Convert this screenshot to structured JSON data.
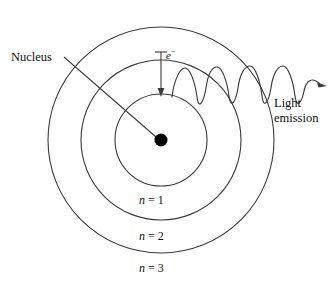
{
  "figure": {
    "type": "bohr-atomic-model-diagram",
    "background_color": "#ffffff",
    "stroke_color": "#3a3a3a",
    "nucleus_fill": "#000000"
  },
  "labels": {
    "nucleus": "Nucleus",
    "electron_symbol": "e",
    "electron_charge": "−",
    "light_emission_line1": "Light",
    "light_emission_line2": "emission",
    "shell_1_n": "n",
    "shell_1_value": "= 1",
    "shell_2_n": "n",
    "shell_2_value": "= 2",
    "shell_3_n": "n",
    "shell_3_value": "= 3"
  },
  "geometry": {
    "center_x": 161,
    "center_y": 140,
    "nucleus_radius": 6,
    "shells": [
      {
        "name": "n = 1",
        "radius": 46
      },
      {
        "name": "n = 2",
        "radius": 80
      },
      {
        "name": "n = 3",
        "radius": 113
      }
    ],
    "electron_transition_arrow": {
      "from_x": 161,
      "from_y": 52,
      "to_x": 161,
      "to_y": 96,
      "cap_x1": 155,
      "cap_x2": 167,
      "cap_y": 52
    },
    "nucleus_leader_line": {
      "from_x": 64,
      "from_y": 57,
      "to_x": 156,
      "to_y": 137
    },
    "light_wave": {
      "start_x": 172,
      "start_y": 97,
      "end_x": 322,
      "end_y": 86,
      "cycles": 4.5,
      "amplitude": 15,
      "arrow_tip_x": 327,
      "arrow_tip_y": 86
    }
  }
}
